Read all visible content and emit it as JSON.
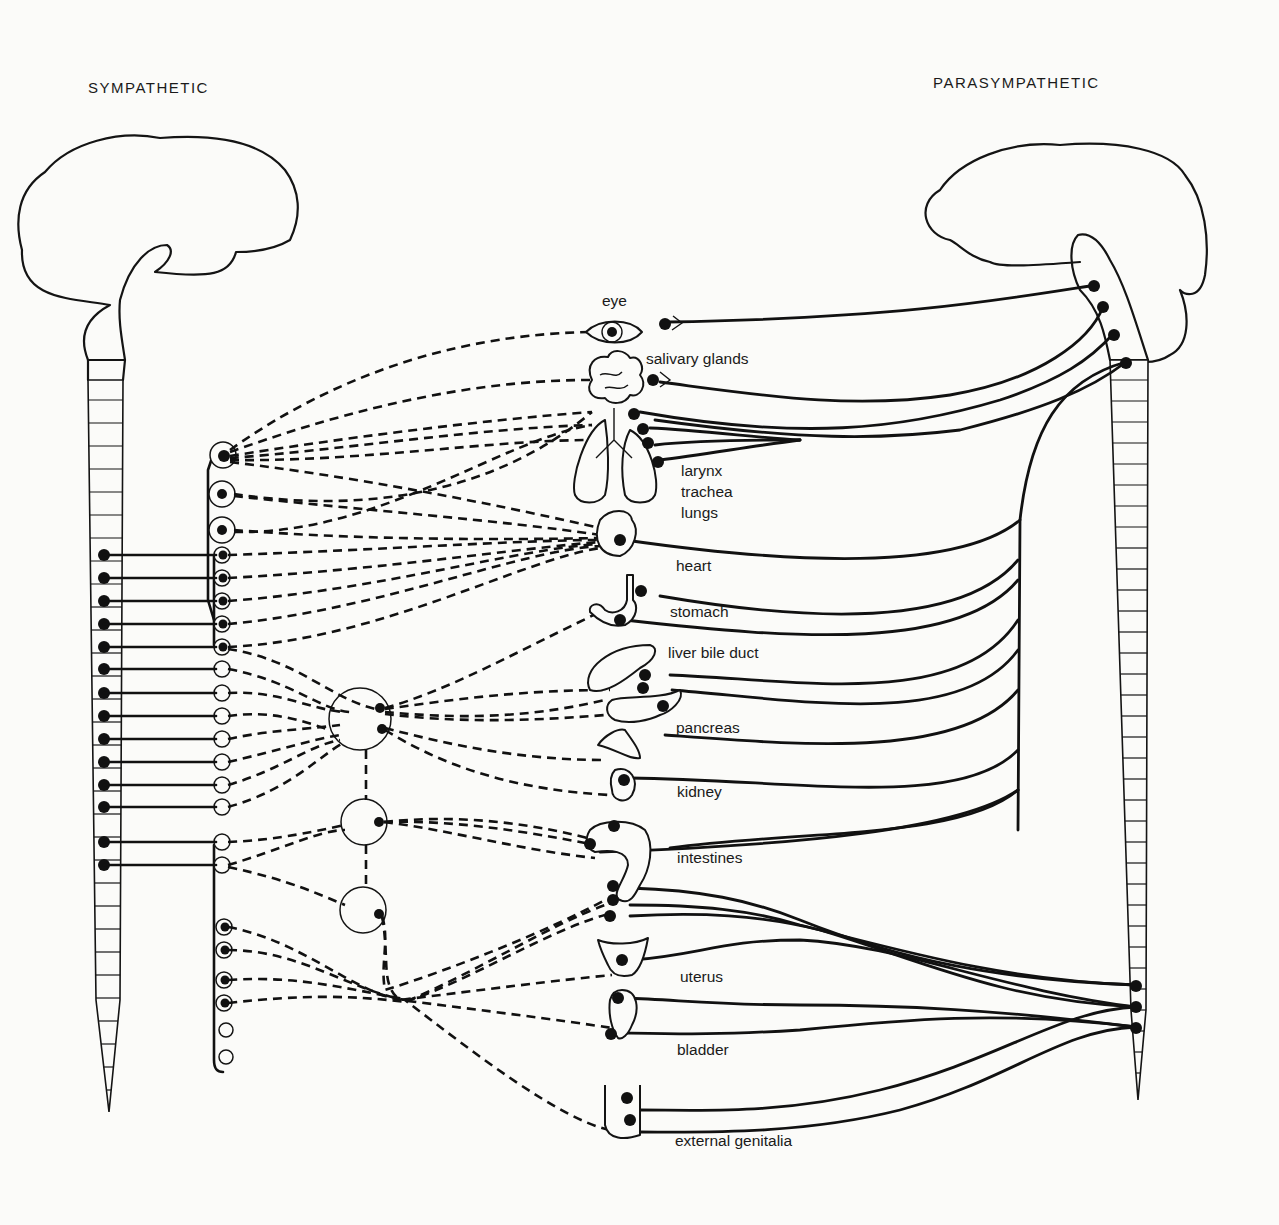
{
  "diagram": {
    "type": "autonomic nervous system schematic",
    "left_title": "SYMPATHETIC",
    "right_title": "PARASYMPATHETIC",
    "organs": [
      {
        "key": "eye",
        "label": "eye"
      },
      {
        "key": "salivary",
        "label": "salivary glands"
      },
      {
        "key": "larynx",
        "label": "larynx"
      },
      {
        "key": "trachea",
        "label": "trachea"
      },
      {
        "key": "lungs",
        "label": "lungs"
      },
      {
        "key": "heart",
        "label": "heart"
      },
      {
        "key": "stomach",
        "label": "stomach"
      },
      {
        "key": "liver",
        "label": "liver  bile duct"
      },
      {
        "key": "pancreas",
        "label": "pancreas"
      },
      {
        "key": "kidney",
        "label": "kidney"
      },
      {
        "key": "intestines",
        "label": "intestines"
      },
      {
        "key": "uterus",
        "label": "uterus"
      },
      {
        "key": "bladder",
        "label": "bladder"
      },
      {
        "key": "genitalia",
        "label": "external genitalia"
      }
    ],
    "legend": {
      "solid_line": "preganglionic fiber",
      "dashed_line": "postganglionic fiber (sympathetic)",
      "filled_dot": "neuron cell body",
      "open_circle": "ganglion"
    },
    "colors": {
      "ink": "#111111",
      "paper": "#fbfbf9"
    }
  }
}
